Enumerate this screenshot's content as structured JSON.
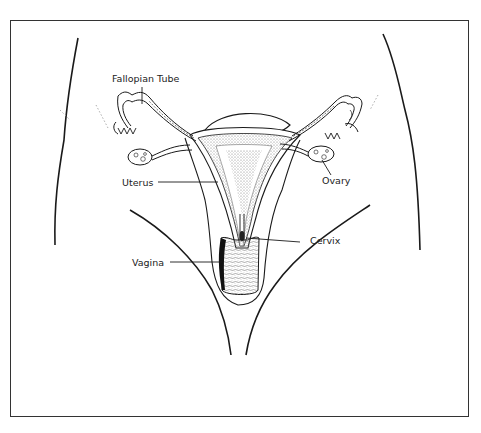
{
  "figure": {
    "labels": {
      "fallopian_tube": "Fallopian Tube",
      "uterus": "Uterus",
      "ovary": "Ovary",
      "cervix": "Cervix",
      "vagina": "Vagina"
    },
    "colors": {
      "line": "#1a1a1a",
      "frame": "#333333",
      "stipple": "#8a8a8a",
      "background": "#ffffff"
    }
  }
}
